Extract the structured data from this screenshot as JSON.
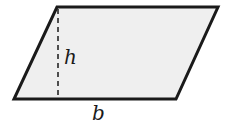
{
  "diagram": {
    "shape": "parallelogram",
    "fill_color": "#efefef",
    "stroke_color": "#1a1a1a",
    "labels": {
      "height": "h",
      "base": "b"
    }
  }
}
